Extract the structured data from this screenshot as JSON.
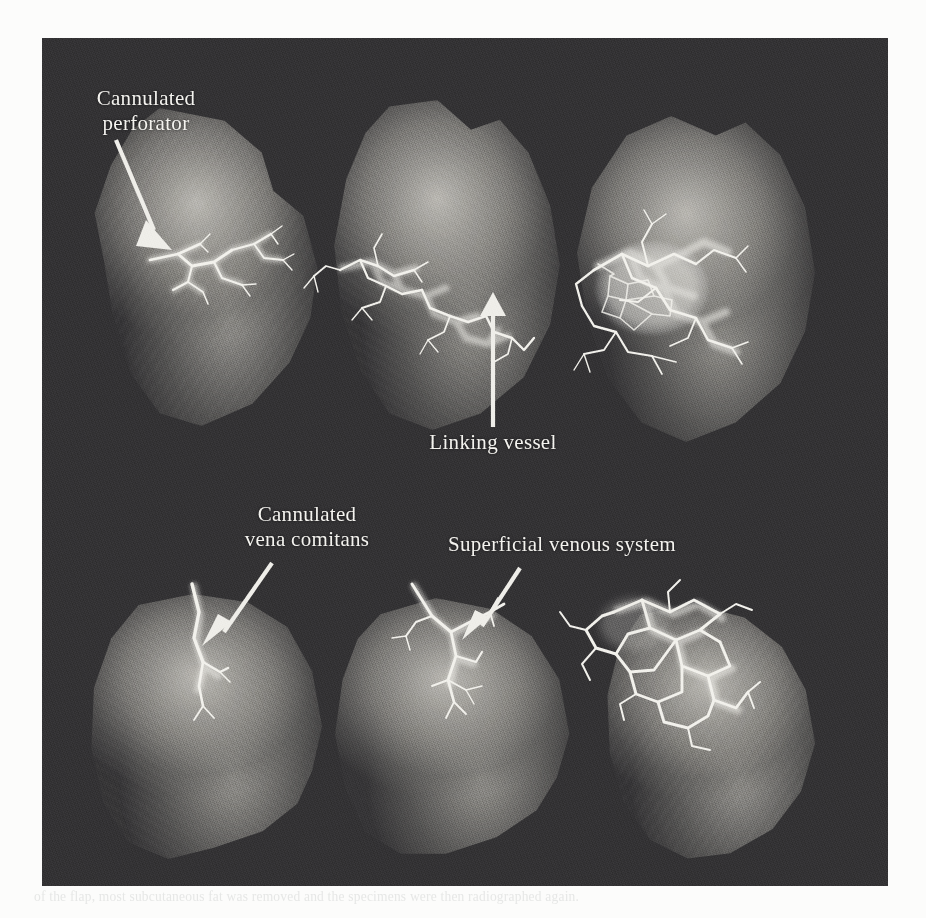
{
  "figure": {
    "kind": "angiogram-plate",
    "plate_background_color": "#333234",
    "page_background_color": "#fcfcfb",
    "annotation_text_color": "#f4f3ef",
    "vessel_color": "#f2f1ec",
    "ghost_caption": "of the flap, most subcutaneous fat was removed and the specimens were then radiographed again."
  },
  "annotations": [
    {
      "id": "cannulated-perforator",
      "label": "Cannulated\nperforator",
      "panel": "top-left",
      "arrow": {
        "from_x": 116,
        "from_y": 140,
        "to_x": 163,
        "to_y": 247,
        "style": "diagonal-down-right"
      }
    },
    {
      "id": "linking-vessel",
      "label": "Linking vessel",
      "panel": "top-middle",
      "arrow": {
        "from_x": 493,
        "from_y": 427,
        "to_x": 493,
        "to_y": 299,
        "style": "vertical-up"
      }
    },
    {
      "id": "cannulated-vena-comitans",
      "label": "Cannulated\nvena comitans",
      "panel": "bottom-left",
      "arrow": {
        "from_x": 272,
        "from_y": 563,
        "to_x": 207,
        "to_y": 644,
        "style": "diagonal-down-left"
      }
    },
    {
      "id": "superficial-venous-system",
      "label": "Superficial venous system",
      "panel": "bottom-middle",
      "arrow": {
        "from_x": 520,
        "from_y": 568,
        "to_x": 471,
        "to_y": 639,
        "style": "diagonal-down-left"
      }
    }
  ],
  "panels": [
    {
      "id": "top-left",
      "row": 1,
      "col": 1,
      "vessel_density": "sparse",
      "description": "flap with single cannulated perforator and small branching tree"
    },
    {
      "id": "top-middle",
      "row": 1,
      "col": 2,
      "vessel_density": "moderate",
      "description": "flap showing perforator tree plus linking vessel to adjacent territory"
    },
    {
      "id": "top-right",
      "row": 1,
      "col": 3,
      "vessel_density": "dense",
      "description": "flap with large opacified vascular blush and extensive network"
    },
    {
      "id": "bottom-left",
      "row": 2,
      "col": 1,
      "vessel_density": "very-sparse",
      "description": "flap with cannulated vena comitans entering at upper border"
    },
    {
      "id": "bottom-middle",
      "row": 2,
      "col": 2,
      "vessel_density": "sparse",
      "description": "flap with superficial venous system filling from cannulated vein"
    },
    {
      "id": "bottom-right",
      "row": 2,
      "col": 3,
      "vessel_density": "dense",
      "description": "flap with polygonal superficial venous arcades"
    }
  ]
}
